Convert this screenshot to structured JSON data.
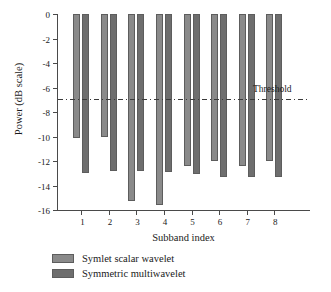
{
  "chart_data": {
    "type": "bar",
    "title": "",
    "xlabel": "Subband index",
    "ylabel": "Power (dB scale)",
    "categories": [
      "1",
      "2",
      "3",
      "4",
      "5",
      "6",
      "7",
      "8"
    ],
    "ylim": [
      -16,
      0
    ],
    "yticks": [
      0,
      -2,
      -4,
      -6,
      -8,
      -10,
      -12,
      -14,
      -16
    ],
    "ytick_labels": [
      "0",
      "-2",
      "-4",
      "-6",
      "-8",
      "-10",
      "-12",
      "-14",
      "-16"
    ],
    "grid": false,
    "legend_position": "below-left",
    "series": [
      {
        "name": "Symlet scalar wavelet",
        "color": "#8a8a8a",
        "values": [
          -10.1,
          -10.0,
          -15.3,
          -15.6,
          -12.4,
          -12.0,
          -12.4,
          -12.0
        ]
      },
      {
        "name": "Symmetric multiwavelet",
        "color": "#6e6e6e",
        "values": [
          -13.0,
          -12.8,
          -12.8,
          -12.9,
          -13.1,
          -13.3,
          -13.3,
          -13.3
        ]
      }
    ],
    "annotations": [
      {
        "name": "threshold",
        "label": "Threshold",
        "value": -7.0,
        "style": "dash-dot",
        "color": "#3a3a3a"
      }
    ]
  }
}
